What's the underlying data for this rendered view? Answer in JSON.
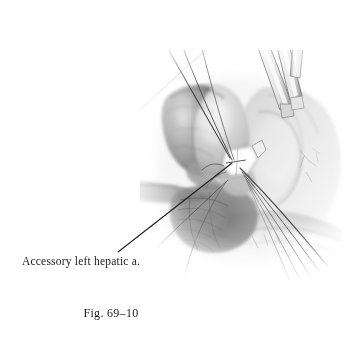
{
  "figure": {
    "caption": "Fig. 69–10",
    "alt_description": "Grayscale surgical pencil illustration showing dissection of an accessory left hepatic artery with ligature sutures and a retractor instrument",
    "background_color": "#ffffff",
    "ink_color": "#1c1c1c"
  },
  "annotations": [
    {
      "id": "accessory-left-hepatic-artery",
      "text": "Accessory left hepatic a.",
      "leader_line": {
        "from_x": 118,
        "from_y": 252,
        "to_x": 232,
        "to_y": 163
      }
    }
  ],
  "illustration": {
    "type": "surgical-line-and-wash-drawing",
    "tones": {
      "tissue_mid": "#9a9a9a",
      "tissue_dark": "#5e5e5e",
      "tissue_light": "#cfcfcf",
      "tissue_pale": "#e6e6e6",
      "suture_dark": "#2a2a2a",
      "instrument_metal": "#f2f2f2",
      "instrument_edge": "#6a6a6a",
      "clip_highlight": "#fbfbfb"
    },
    "elements": [
      {
        "name": "left-hepatic-lobe",
        "description": "rounded tissue lobe upper left of center"
      },
      {
        "name": "right-tissue-mass",
        "description": "lighter tissue mass on right side"
      },
      {
        "name": "lesser-omentum-band",
        "description": "thin tissue band extending to the left"
      },
      {
        "name": "vessel-clip",
        "description": "white metallic ligature clip at vessel convergence"
      },
      {
        "name": "retractor-instrument",
        "description": "metallic retractor blades entering from top right"
      },
      {
        "name": "suture-strands",
        "description": "multiple fine suture threads converging at the vessel and trailing lower right"
      }
    ]
  }
}
